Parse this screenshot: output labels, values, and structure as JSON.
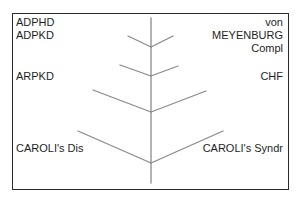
{
  "diagram": {
    "type": "branching-tree",
    "colors": {
      "frame": "#2a2a2a",
      "branches": "#8a8a8a",
      "text": "#1e1e1e"
    },
    "left_labels": [
      {
        "text": "ADPHD"
      },
      {
        "text": "ADPKD"
      },
      {
        "text": "ARPKD"
      },
      {
        "text": "CAROLI's Dis"
      }
    ],
    "right_labels": [
      {
        "text": "von"
      },
      {
        "text": "MEYENBURG"
      },
      {
        "text": "Compl"
      },
      {
        "text": "CHF"
      },
      {
        "text": "CAROLI's Syndr"
      }
    ]
  }
}
